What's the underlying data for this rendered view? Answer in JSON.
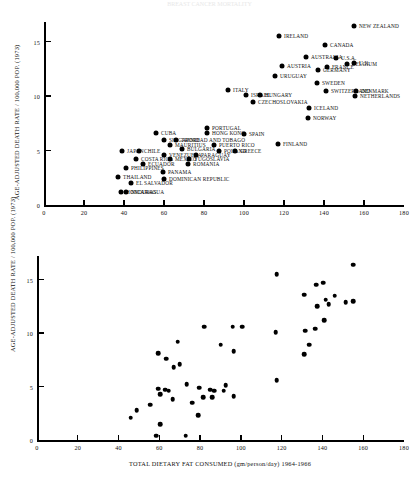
{
  "figure": {
    "faint_header": "BREAST CANCER MORTALITY",
    "ylabel": "AGE-ADJUSTED DEATH RATE / 100,000 POP. (1973)",
    "xlabel_bottom": "TOTAL DIETARY FAT CONSUMED (gm/person/day) 1964-1966"
  },
  "chart_data": [
    {
      "type": "scatter",
      "title": "",
      "xlabel": "",
      "ylabel": "AGE-ADJUSTED DEATH RATE / 100,000 POP. (1973)",
      "xlim": [
        0,
        180
      ],
      "ylim": [
        0,
        16.8
      ],
      "xticks": [
        0,
        20,
        40,
        60,
        80,
        100,
        120,
        140,
        160,
        180
      ],
      "yticks": [
        0,
        5,
        10,
        15
      ],
      "grid": false,
      "legend": "none",
      "labelled": true,
      "points": [
        {
          "label": "NEW ZEALAND",
          "x": 155.0,
          "y": 16.4,
          "side": "r"
        },
        {
          "label": "IRELAND",
          "x": 117.5,
          "y": 15.5,
          "side": "r"
        },
        {
          "label": "CANADA",
          "x": 140.5,
          "y": 14.7,
          "side": "r"
        },
        {
          "label": "AUSTRALIA",
          "x": 131.0,
          "y": 13.6,
          "side": "r"
        },
        {
          "label": "U.S.A.",
          "x": 146.0,
          "y": 13.5,
          "side": "r"
        },
        {
          "label": "AUSTRIA",
          "x": 119.0,
          "y": 12.8,
          "side": "r"
        },
        {
          "label": "GERMANY",
          "x": 137.0,
          "y": 12.4,
          "side": "r"
        },
        {
          "label": "BELGIUM",
          "x": 151.5,
          "y": 12.9,
          "side": "r"
        },
        {
          "label": "FRANCE",
          "x": 141.5,
          "y": 12.7,
          "side": "r"
        },
        {
          "label": "U.K.",
          "x": 155.0,
          "y": 13.0,
          "side": "r"
        },
        {
          "label": "URUGUAY",
          "x": 115.5,
          "y": 11.8,
          "side": "r"
        },
        {
          "label": "SWEDEN",
          "x": 136.5,
          "y": 11.2,
          "side": "r"
        },
        {
          "label": "SWITZERLAND",
          "x": 141.0,
          "y": 10.5,
          "side": "r"
        },
        {
          "label": "DENMARK",
          "x": 156.0,
          "y": 10.5,
          "side": "r"
        },
        {
          "label": "NETHERLANDS",
          "x": 155.5,
          "y": 10.0,
          "side": "r"
        },
        {
          "label": "ITALY",
          "x": 92.0,
          "y": 10.6,
          "side": "r"
        },
        {
          "label": "ISRAEL",
          "x": 101.0,
          "y": 10.1,
          "side": "r"
        },
        {
          "label": "HUNGARY",
          "x": 108.0,
          "y": 10.1,
          "side": "r"
        },
        {
          "label": "CZECHOSLOVAKIA",
          "x": 104.5,
          "y": 9.5,
          "side": "r"
        },
        {
          "label": "ICELAND",
          "x": 132.5,
          "y": 8.9,
          "side": "r"
        },
        {
          "label": "NORWAY",
          "x": 132.0,
          "y": 8.0,
          "side": "r"
        },
        {
          "label": "PORTUGAL",
          "x": 81.5,
          "y": 7.1,
          "side": "r"
        },
        {
          "label": "HONG KONG",
          "x": 81.5,
          "y": 6.6,
          "side": "r"
        },
        {
          "label": "SPAIN",
          "x": 100.0,
          "y": 6.5,
          "side": "r"
        },
        {
          "label": "CUBA",
          "x": 56.0,
          "y": 6.6,
          "side": "r"
        },
        {
          "label": "SINGAPORE",
          "x": 60.0,
          "y": 6.0,
          "side": "r"
        },
        {
          "label": "TRINIDAD AND TOBAGO",
          "x": 66.0,
          "y": 6.0,
          "side": "r"
        },
        {
          "label": "MAURITIUS",
          "x": 63.0,
          "y": 5.5,
          "side": "r"
        },
        {
          "label": "PUERTO RICO",
          "x": 85.0,
          "y": 5.5,
          "side": "r"
        },
        {
          "label": "FINLAND",
          "x": 117.0,
          "y": 5.6,
          "side": "r"
        },
        {
          "label": "JAPAN",
          "x": 39.0,
          "y": 5.0,
          "side": "r"
        },
        {
          "label": "CHILE",
          "x": 47.5,
          "y": 5.0,
          "side": "r"
        },
        {
          "label": "BULGARIA",
          "x": 69.0,
          "y": 5.1,
          "side": "r"
        },
        {
          "label": "POLAND",
          "x": 87.5,
          "y": 5.0,
          "side": "r"
        },
        {
          "label": "GREECE",
          "x": 95.5,
          "y": 5.0,
          "side": "r"
        },
        {
          "label": "VENEZUELA",
          "x": 60.0,
          "y": 4.6,
          "side": "r"
        },
        {
          "label": "PARAGUAY",
          "x": 76.0,
          "y": 4.6,
          "side": "r"
        },
        {
          "label": "COSTA RICA",
          "x": 46.0,
          "y": 4.2,
          "side": "r"
        },
        {
          "label": "MEXICO",
          "x": 63.0,
          "y": 4.2,
          "side": "r"
        },
        {
          "label": "YUGOSLAVIA",
          "x": 72.5,
          "y": 4.2,
          "side": "r"
        },
        {
          "label": "ECUADOR",
          "x": 49.5,
          "y": 3.8,
          "side": "r"
        },
        {
          "label": "ROMANIA",
          "x": 72.0,
          "y": 3.8,
          "side": "r"
        },
        {
          "label": "PHILIPPINES",
          "x": 41.0,
          "y": 3.4,
          "side": "r"
        },
        {
          "label": "PANAMA",
          "x": 59.5,
          "y": 3.0,
          "side": "r"
        },
        {
          "label": "THAILAND",
          "x": 37.0,
          "y": 2.6,
          "side": "r"
        },
        {
          "label": "DOMINICAN REPUBLIC",
          "x": 60.0,
          "y": 2.4,
          "side": "r"
        },
        {
          "label": "EL SALVADOR",
          "x": 43.5,
          "y": 2.0,
          "side": "r"
        },
        {
          "label": "HONDURAS",
          "x": 38.5,
          "y": 1.2,
          "side": "r"
        },
        {
          "label": "NICARAGUA",
          "x": 41.0,
          "y": 1.2,
          "side": "r"
        }
      ]
    },
    {
      "type": "scatter",
      "title": "",
      "xlabel": "TOTAL DIETARY FAT CONSUMED (gm/person/day) 1964-1966",
      "ylabel": "AGE-ADJUSTED DEATH RATE / 100,000 POP. (1973)",
      "xlim": [
        0,
        180
      ],
      "ylim": [
        0,
        17.2
      ],
      "xticks": [
        0,
        20,
        40,
        60,
        80,
        100,
        120,
        140,
        160,
        180
      ],
      "yticks": [
        0,
        5,
        10,
        15
      ],
      "grid": false,
      "legend": "none",
      "labelled": false,
      "points": [
        {
          "x": 155.0,
          "y": 16.4
        },
        {
          "x": 117.5,
          "y": 15.5
        },
        {
          "x": 140.5,
          "y": 14.7
        },
        {
          "x": 137.0,
          "y": 14.5
        },
        {
          "x": 131.0,
          "y": 13.6
        },
        {
          "x": 146.0,
          "y": 13.5
        },
        {
          "x": 141.5,
          "y": 13.1
        },
        {
          "x": 151.5,
          "y": 12.9
        },
        {
          "x": 155.0,
          "y": 13.0
        },
        {
          "x": 137.5,
          "y": 12.5
        },
        {
          "x": 143.0,
          "y": 12.7
        },
        {
          "x": 141.0,
          "y": 11.2
        },
        {
          "x": 82.0,
          "y": 10.6
        },
        {
          "x": 96.0,
          "y": 10.6
        },
        {
          "x": 100.5,
          "y": 10.6
        },
        {
          "x": 136.5,
          "y": 10.4
        },
        {
          "x": 131.5,
          "y": 10.2
        },
        {
          "x": 117.0,
          "y": 10.1
        },
        {
          "x": 69.0,
          "y": 9.2
        },
        {
          "x": 90.0,
          "y": 8.9
        },
        {
          "x": 133.5,
          "y": 8.9
        },
        {
          "x": 96.5,
          "y": 8.3
        },
        {
          "x": 59.5,
          "y": 8.1
        },
        {
          "x": 131.0,
          "y": 8.0
        },
        {
          "x": 63.5,
          "y": 7.6
        },
        {
          "x": 70.0,
          "y": 7.1
        },
        {
          "x": 67.0,
          "y": 6.8
        },
        {
          "x": 117.5,
          "y": 5.6
        },
        {
          "x": 73.5,
          "y": 5.2
        },
        {
          "x": 92.5,
          "y": 5.1
        },
        {
          "x": 59.5,
          "y": 4.8
        },
        {
          "x": 79.5,
          "y": 4.9
        },
        {
          "x": 63.0,
          "y": 4.7
        },
        {
          "x": 85.0,
          "y": 4.7
        },
        {
          "x": 87.0,
          "y": 4.6
        },
        {
          "x": 91.5,
          "y": 4.6
        },
        {
          "x": 60.5,
          "y": 4.3
        },
        {
          "x": 64.5,
          "y": 4.6
        },
        {
          "x": 96.5,
          "y": 4.1
        },
        {
          "x": 81.5,
          "y": 4.0
        },
        {
          "x": 86.0,
          "y": 4.0
        },
        {
          "x": 66.5,
          "y": 3.8
        },
        {
          "x": 76.0,
          "y": 3.5
        },
        {
          "x": 55.5,
          "y": 3.3
        },
        {
          "x": 49.0,
          "y": 2.8
        },
        {
          "x": 46.0,
          "y": 2.1
        },
        {
          "x": 79.0,
          "y": 2.3
        },
        {
          "x": 60.5,
          "y": 1.5
        },
        {
          "x": 58.5,
          "y": 0.4
        },
        {
          "x": 73.0,
          "y": 0.4
        }
      ]
    }
  ]
}
